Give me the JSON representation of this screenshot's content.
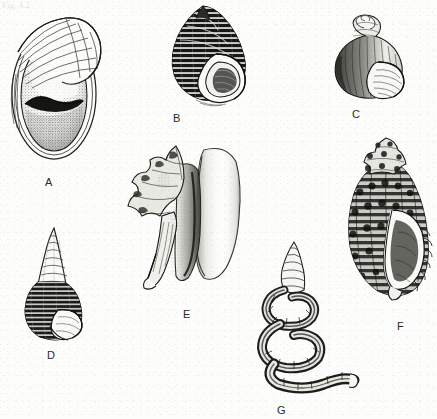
{
  "plate": {
    "title": "Gastropod shell plate",
    "background_color": "#fdfdfb",
    "ink_color": "#1a1a18",
    "label_color": "#2a2a28",
    "width": 437,
    "height": 419,
    "medium": "pen-and-ink stipple line drawing (scanned)",
    "scan_artifact_text": "Fig. 4.2"
  },
  "figures": [
    {
      "id": "A",
      "label": "A",
      "name": "ear-shaped abalone shell",
      "description": "Large flattened oval ear-shaped shell seen from the aperture side, with a broad stippled body whorl, a narrow arched fan of growth ribs curving over the upper right margin, and a dark crescent-shaped shadow across the middle of the aperture.",
      "label_x": 45,
      "label_y": 176,
      "fig_x": 4,
      "fig_y": 8,
      "fig_w": 104,
      "fig_h": 160
    },
    {
      "id": "B",
      "label": "B",
      "name": "dark banded globose snail shell",
      "description": "Conical-globose snail with a pointed spire, body whorl covered in dense dark spiral bands and fine axial lines, and a pale teardrop-shaped aperture with a thick reflected white outer lip at the lower right.",
      "label_x": 173,
      "label_y": 112,
      "fig_x": 156,
      "fig_y": 4,
      "fig_w": 104,
      "fig_h": 104
    },
    {
      "id": "C",
      "label": "C",
      "name": "globose periwinkle shell",
      "description": "Small rounded shell with a short stepped conical spire of about four whorls, fine axial striations shaded on the left side, and a large oval aperture with concentric lines at the lower right.",
      "label_x": 352,
      "label_y": 108,
      "fig_x": 326,
      "fig_y": 14,
      "fig_w": 88,
      "fig_h": 88
    },
    {
      "id": "D",
      "label": "D",
      "name": "tall turreted spire shell",
      "description": "Slender high-spired shell tapering to a sharp apex; the upper whorls are pale with simple suture lines while the lower whorls and body whorl are heavily shaded with dark spiral banding, ending in a small aperture at the base.",
      "label_x": 47,
      "label_y": 349,
      "fig_x": 16,
      "fig_y": 226,
      "fig_w": 78,
      "fig_h": 120
    },
    {
      "id": "E",
      "label": "E",
      "name": "spiny conch shell with flared lip",
      "description": "Large conch shown aperture-side; a knobbed spiny spire projects to the upper left, a long tapering anterior canal runs down to the lower left, and a very broad smooth pale flared outer lip fills the right half with soft stippled shading along its inner edge.",
      "label_x": 183,
      "label_y": 308,
      "fig_x": 126,
      "fig_y": 142,
      "fig_w": 116,
      "fig_h": 148
    },
    {
      "id": "F",
      "label": "F",
      "name": "knobbed whelk or murex shell",
      "description": "Robust heavily sculptured shell with a stepped knobby spire, strong spiral cords and nodules over the whole surface, a pale elongate aperture down the right side and a ribbed, crenulated outer lip.",
      "label_x": 397,
      "label_y": 320,
      "fig_x": 342,
      "fig_y": 136,
      "fig_w": 94,
      "fig_h": 166
    },
    {
      "id": "G",
      "label": "G",
      "name": "loosely coiled worm shell",
      "description": "Irregular corkscrew shell: a tightly wound tapering spire at the top unwinds into wide loose open coils that descend and trail off to the lower right as a tubular worm-like extension, marked throughout with dark spiral threads.",
      "label_x": 277,
      "label_y": 404,
      "fig_x": 250,
      "fig_y": 240,
      "fig_w": 108,
      "fig_h": 152
    }
  ]
}
